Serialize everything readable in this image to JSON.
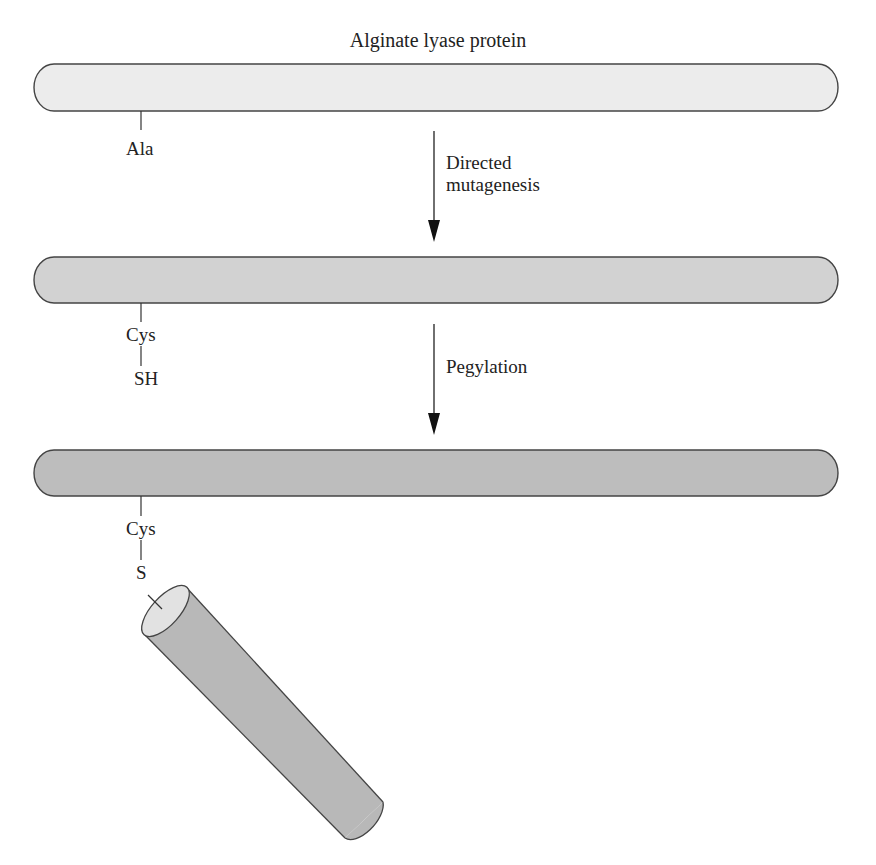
{
  "title": "Alginate lyase protein",
  "colors": {
    "bar_1_fill": "#ececec",
    "bar_2_fill": "#d2d2d2",
    "bar_3_fill": "#bdbdbd",
    "outline": "#444444",
    "peg_body": "#b8b8b8",
    "peg_end": "#e2e2e2"
  },
  "stages": [
    {
      "id": "native",
      "residue_label": "Ala",
      "group_label": ""
    },
    {
      "id": "mutant",
      "residue_label": "Cys",
      "group_label": "SH"
    },
    {
      "id": "pegylated",
      "residue_label": "Cys",
      "group_label": "S"
    }
  ],
  "steps": [
    {
      "line1": "Directed",
      "line2": "mutagenesis"
    },
    {
      "line1": "Pegylation",
      "line2": ""
    }
  ],
  "peg": {
    "description": "polyethylene glycol cylinder attached via S"
  }
}
